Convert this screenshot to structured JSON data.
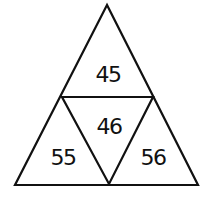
{
  "diagram": {
    "type": "triangle-number-puzzle",
    "line_color": "#111111",
    "background": "#ffffff",
    "cells": {
      "top": "45",
      "center": "46",
      "left": "55",
      "right": "56"
    }
  }
}
